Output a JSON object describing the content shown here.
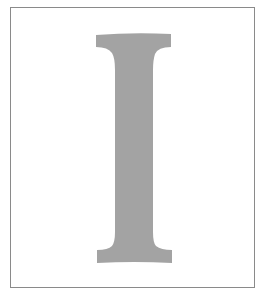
{
  "letter": {
    "character": "I",
    "fill_color": "#a3a3a3"
  },
  "frame": {
    "border_color": "#8a8a8a",
    "background_color": "#ffffff"
  }
}
